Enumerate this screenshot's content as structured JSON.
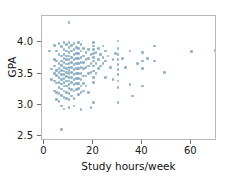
{
  "chart_data": {
    "type": "scatter",
    "title": "",
    "xlabel": "Study hours/week",
    "ylabel": "GPA",
    "xlim": [
      -1,
      70.5
    ],
    "ylim": [
      2.42,
      4.42
    ],
    "xticks": [
      0,
      20,
      40,
      60
    ],
    "xticklabels": [
      "0",
      "20",
      "40",
      "60"
    ],
    "yticks": [
      2.5,
      3.0,
      3.5,
      4.0
    ],
    "yticklabels": [
      "2.5",
      "3.0",
      "3.5",
      "4.0"
    ],
    "grid": false,
    "legend": null,
    "marker_color": "#7ba7bf",
    "frame_color": "#b9b9b9",
    "n_points": 181,
    "points": [
      [
        2,
        3.86
      ],
      [
        3,
        3.57
      ],
      [
        3,
        3.4
      ],
      [
        4,
        3.95
      ],
      [
        4,
        3.72
      ],
      [
        4,
        3.62
      ],
      [
        4,
        3.5
      ],
      [
        4,
        3.38
      ],
      [
        4,
        3.22
      ],
      [
        5,
        3.86
      ],
      [
        5,
        3.7
      ],
      [
        5,
        3.55
      ],
      [
        5,
        3.47
      ],
      [
        5,
        3.35
      ],
      [
        5,
        3.2
      ],
      [
        5,
        3.08
      ],
      [
        6,
        3.98
      ],
      [
        6,
        3.8
      ],
      [
        6,
        3.66
      ],
      [
        6,
        3.58
      ],
      [
        6,
        3.52
      ],
      [
        6,
        3.44
      ],
      [
        6,
        3.36
      ],
      [
        6,
        3.28
      ],
      [
        6,
        3.18
      ],
      [
        6,
        3.05
      ],
      [
        7,
        3.93
      ],
      [
        7,
        3.78
      ],
      [
        7,
        3.7
      ],
      [
        7,
        3.63
      ],
      [
        7,
        3.55
      ],
      [
        7,
        3.48
      ],
      [
        7,
        3.4
      ],
      [
        7,
        3.33
      ],
      [
        7,
        3.25
      ],
      [
        7,
        3.15
      ],
      [
        7,
        2.98
      ],
      [
        7,
        2.6
      ],
      [
        8,
        4.0
      ],
      [
        8,
        3.88
      ],
      [
        8,
        3.8
      ],
      [
        8,
        3.74
      ],
      [
        8,
        3.68
      ],
      [
        8,
        3.6
      ],
      [
        8,
        3.54
      ],
      [
        8,
        3.48
      ],
      [
        8,
        3.42
      ],
      [
        8,
        3.36
      ],
      [
        8,
        3.3
      ],
      [
        8,
        3.22
      ],
      [
        8,
        3.12
      ],
      [
        8,
        2.93
      ],
      [
        9,
        3.96
      ],
      [
        9,
        3.86
      ],
      [
        9,
        3.78
      ],
      [
        9,
        3.72
      ],
      [
        9,
        3.65
      ],
      [
        9,
        3.58
      ],
      [
        9,
        3.52
      ],
      [
        9,
        3.45
      ],
      [
        9,
        3.38
      ],
      [
        9,
        3.3
      ],
      [
        9,
        3.2
      ],
      [
        9,
        3.1
      ],
      [
        10,
        4.32
      ],
      [
        10,
        4.0
      ],
      [
        10,
        3.92
      ],
      [
        10,
        3.84
      ],
      [
        10,
        3.78
      ],
      [
        10,
        3.72
      ],
      [
        10,
        3.66
      ],
      [
        10,
        3.6
      ],
      [
        10,
        3.55
      ],
      [
        10,
        3.5
      ],
      [
        10,
        3.44
      ],
      [
        10,
        3.38
      ],
      [
        10,
        3.32
      ],
      [
        10,
        3.26
      ],
      [
        10,
        3.18
      ],
      [
        10,
        3.08
      ],
      [
        10,
        2.96
      ],
      [
        11,
        3.95
      ],
      [
        11,
        3.86
      ],
      [
        11,
        3.76
      ],
      [
        11,
        3.68
      ],
      [
        11,
        3.6
      ],
      [
        11,
        3.52
      ],
      [
        11,
        3.44
      ],
      [
        11,
        3.36
      ],
      [
        11,
        3.24
      ],
      [
        11,
        3.14
      ],
      [
        12,
        3.98
      ],
      [
        12,
        3.88
      ],
      [
        12,
        3.8
      ],
      [
        12,
        3.72
      ],
      [
        12,
        3.64
      ],
      [
        12,
        3.56
      ],
      [
        12,
        3.48
      ],
      [
        12,
        3.4
      ],
      [
        12,
        3.32
      ],
      [
        12,
        3.22
      ],
      [
        12,
        3.1
      ],
      [
        12,
        2.98
      ],
      [
        13,
        3.92
      ],
      [
        13,
        3.82
      ],
      [
        13,
        3.74
      ],
      [
        13,
        3.66
      ],
      [
        13,
        3.58
      ],
      [
        13,
        3.5
      ],
      [
        13,
        3.42
      ],
      [
        13,
        3.34
      ],
      [
        13,
        3.24
      ],
      [
        14,
        4.0
      ],
      [
        14,
        3.9
      ],
      [
        14,
        3.82
      ],
      [
        14,
        3.74
      ],
      [
        14,
        3.66
      ],
      [
        14,
        3.58
      ],
      [
        14,
        3.5
      ],
      [
        14,
        3.42
      ],
      [
        14,
        3.34
      ],
      [
        14,
        3.26
      ],
      [
        14,
        3.16
      ],
      [
        15,
        3.96
      ],
      [
        15,
        3.86
      ],
      [
        15,
        3.76
      ],
      [
        15,
        3.68
      ],
      [
        15,
        3.6
      ],
      [
        15,
        3.5
      ],
      [
        15,
        3.4
      ],
      [
        15,
        3.3
      ],
      [
        15,
        3.2
      ],
      [
        15,
        2.92
      ],
      [
        16,
        3.9
      ],
      [
        16,
        3.78
      ],
      [
        16,
        3.68
      ],
      [
        16,
        3.58
      ],
      [
        16,
        3.46
      ],
      [
        16,
        3.34
      ],
      [
        16,
        3.22
      ],
      [
        17,
        3.84
      ],
      [
        17,
        3.72
      ],
      [
        17,
        3.6
      ],
      [
        17,
        3.46
      ],
      [
        17,
        3.3
      ],
      [
        18,
        3.88
      ],
      [
        18,
        3.74
      ],
      [
        18,
        3.62
      ],
      [
        18,
        3.5
      ],
      [
        18,
        3.2
      ],
      [
        19,
        3.8
      ],
      [
        19,
        3.66
      ],
      [
        19,
        3.52
      ],
      [
        19,
        2.96
      ],
      [
        20,
        4.0
      ],
      [
        20,
        3.94
      ],
      [
        20,
        3.88
      ],
      [
        20,
        3.82
      ],
      [
        20,
        3.76
      ],
      [
        20,
        3.7
      ],
      [
        20,
        3.62
      ],
      [
        20,
        3.54
      ],
      [
        20,
        3.44
      ],
      [
        20,
        3.36
      ],
      [
        20,
        3.04
      ],
      [
        21,
        3.84
      ],
      [
        21,
        3.66
      ],
      [
        21,
        3.5
      ],
      [
        22,
        3.9
      ],
      [
        22,
        3.72
      ],
      [
        22,
        3.58
      ],
      [
        23,
        3.8
      ],
      [
        23,
        3.62
      ],
      [
        24,
        3.94
      ],
      [
        24,
        3.76
      ],
      [
        24,
        3.66
      ],
      [
        25,
        3.86
      ],
      [
        25,
        3.7
      ],
      [
        25,
        3.44
      ],
      [
        26,
        3.78
      ],
      [
        27,
        3.6
      ],
      [
        28,
        3.72
      ],
      [
        28,
        3.4
      ],
      [
        29,
        3.82
      ],
      [
        30,
        4.02
      ],
      [
        30,
        3.9
      ],
      [
        30,
        3.8
      ],
      [
        30,
        3.72
      ],
      [
        30,
        3.64
      ],
      [
        30,
        3.56
      ],
      [
        30,
        3.48
      ],
      [
        30,
        3.38
      ],
      [
        30,
        3.28
      ],
      [
        30,
        3.04
      ],
      [
        32,
        3.74
      ],
      [
        33,
        3.6
      ],
      [
        35,
        3.86
      ],
      [
        35,
        3.32
      ],
      [
        36,
        3.14
      ],
      [
        38,
        3.66
      ],
      [
        40,
        3.84
      ],
      [
        40,
        3.7
      ],
      [
        40,
        3.58
      ],
      [
        40,
        3.3
      ],
      [
        42,
        3.74
      ],
      [
        45,
        3.94
      ],
      [
        45,
        3.7
      ],
      [
        49,
        3.52
      ],
      [
        60,
        3.85
      ],
      [
        70,
        3.87
      ]
    ]
  }
}
